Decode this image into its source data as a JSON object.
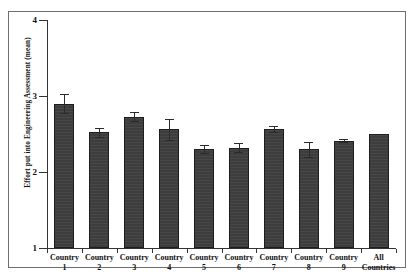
{
  "figure": {
    "background_color": "#ffffff",
    "frame_color": "#6e6e6e",
    "bar_color": "#3d3d3d",
    "axis_color": "#333333"
  },
  "chart_data": {
    "type": "bar",
    "title": "",
    "xlabel": "",
    "ylabel": "Effort put into Engineering Assessment (mean)",
    "ylim": [
      1,
      4
    ],
    "yticks": [
      1,
      2,
      3,
      4
    ],
    "ytick_labels": [
      "1",
      "2",
      "3",
      "4"
    ],
    "grid": false,
    "legend": null,
    "categories": [
      "Country\n1",
      "Country\n2",
      "Country\n3",
      "Country\n4",
      "Country\n5",
      "Country\n6",
      "Country\n7",
      "Country\n8",
      "Country\n9",
      "All\nCountries"
    ],
    "values": [
      2.9,
      2.52,
      2.73,
      2.56,
      2.3,
      2.32,
      2.57,
      2.3,
      2.41,
      2.5
    ],
    "errors": [
      0.13,
      0.06,
      0.06,
      0.14,
      0.05,
      0.06,
      0.04,
      0.1,
      0.02,
      0.0
    ],
    "error_type": "standard error of the mean"
  }
}
